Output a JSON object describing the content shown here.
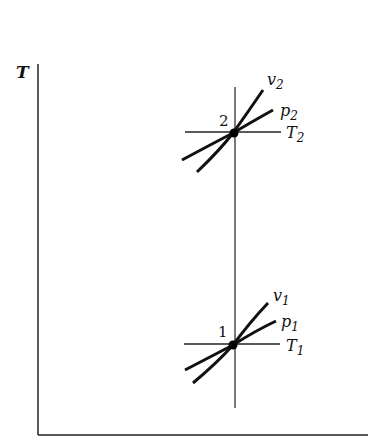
{
  "diagram": {
    "axes": {
      "y_label": "T",
      "x_label": ""
    },
    "states": [
      {
        "id": "state-2",
        "number": "2",
        "v_label": "v",
        "v_sub": "2",
        "p_label": "p",
        "p_sub": "2",
        "T_label": "T",
        "T_sub": "2"
      },
      {
        "id": "state-1",
        "number": "1",
        "v_label": "v",
        "v_sub": "1",
        "p_label": "p",
        "p_sub": "1",
        "T_label": "T",
        "T_sub": "1"
      }
    ],
    "colors": {
      "line": "#111111",
      "background": "#ffffff"
    }
  }
}
